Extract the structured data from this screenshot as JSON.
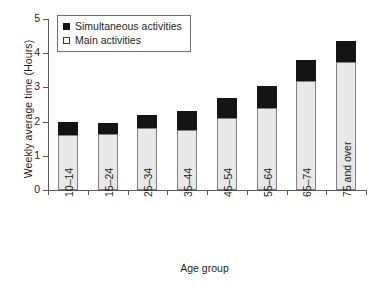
{
  "chart_data": {
    "type": "bar",
    "stacked": true,
    "title": "",
    "xlabel": "Age group",
    "ylabel": "Weekly average time (Hours)",
    "ylim": [
      0,
      5
    ],
    "yticks": [
      0,
      1,
      2,
      3,
      4,
      5
    ],
    "ytick_labels": [
      "0",
      "1",
      "2",
      "3",
      "4",
      "5"
    ],
    "grid": false,
    "legend_position": "top-left",
    "categories": [
      "10–14",
      "15–24",
      "25–34",
      "35–44",
      "45–54",
      "55–64",
      "65–74",
      "75 and over"
    ],
    "series": [
      {
        "name": "Main activities",
        "color": "#e8e8e8",
        "values": [
          1.6,
          1.65,
          1.8,
          1.75,
          2.1,
          2.4,
          3.2,
          3.75
        ]
      },
      {
        "name": "Simultaneous activities",
        "color": "#141414",
        "values": [
          0.4,
          0.3,
          0.4,
          0.55,
          0.6,
          0.65,
          0.6,
          0.6
        ]
      }
    ],
    "totals": [
      2.0,
      1.95,
      2.2,
      2.3,
      2.7,
      3.05,
      3.8,
      4.35
    ]
  },
  "legend": {
    "items": [
      {
        "label": "Simultaneous activities",
        "marker": "filled-square-icon"
      },
      {
        "label": "Main activities",
        "marker": "open-square-icon"
      }
    ]
  }
}
